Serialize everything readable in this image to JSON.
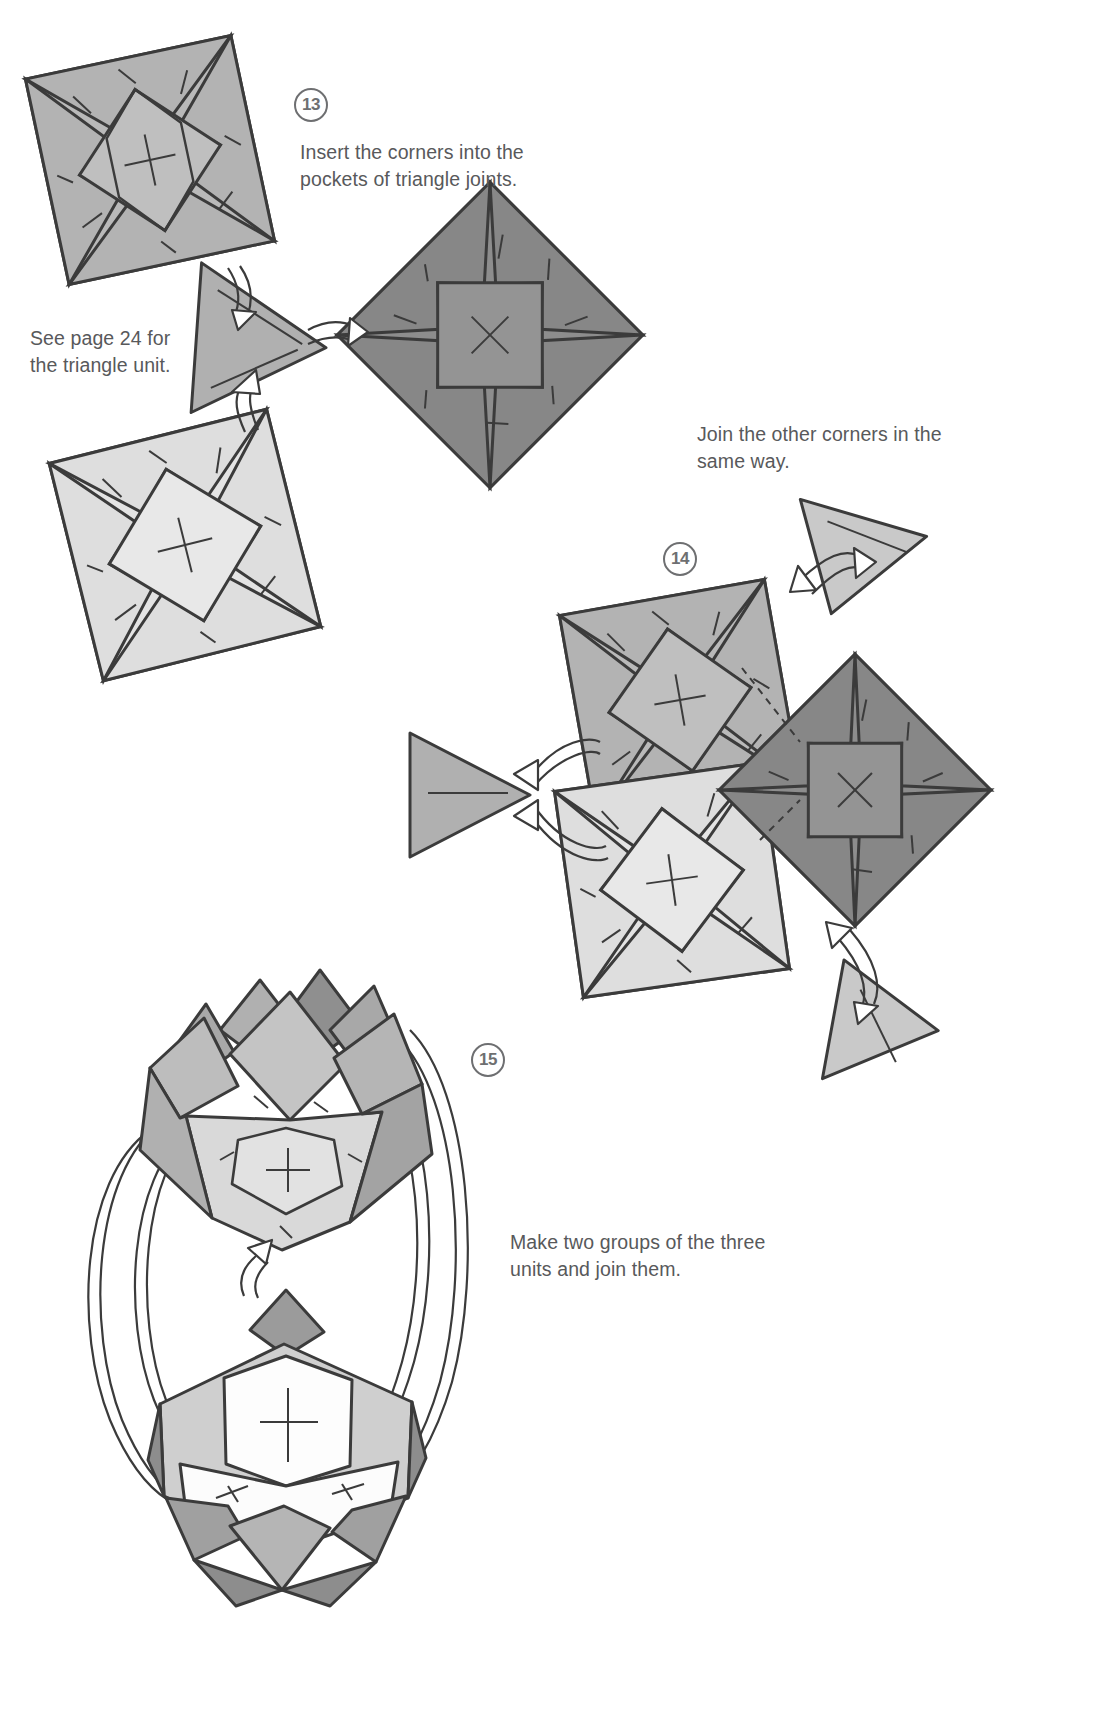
{
  "page": {
    "background": "#ffffff",
    "width": 1093,
    "height": 1735
  },
  "steps": [
    {
      "id": "step-13",
      "number": "13",
      "caption": "Insert the corners into the\npockets of triangle joints.",
      "note": "See page 24 for\nthe triangle unit."
    },
    {
      "id": "step-14",
      "number": "14",
      "caption": "Join the other corners in the\nsame way."
    },
    {
      "id": "step-15",
      "number": "15",
      "caption": "Make two groups of the three\nunits and join them."
    }
  ],
  "colors": {
    "ink": "#3b3b3b",
    "text": "#58595b",
    "square_light": "#e4e4e4",
    "square_mid": "#b9b9b9",
    "square_dark": "#8d8d8d",
    "triangle_mid": "#b0b0b0",
    "triangle_light": "#c9c9c9",
    "arrow_fill": "#ffffff",
    "white_face": "#fdfdfd"
  },
  "figures": {
    "step13": {
      "units": [
        {
          "name": "square-unit-upper-left",
          "tone": "mid"
        },
        {
          "name": "triangle-joint-center",
          "tone": "triangle_mid"
        },
        {
          "name": "square-unit-right-dark",
          "tone": "dark"
        },
        {
          "name": "square-unit-lower-left",
          "tone": "light"
        }
      ],
      "arrows": 2
    },
    "step14": {
      "units": [
        {
          "name": "square-unit-top",
          "tone": "mid"
        },
        {
          "name": "square-unit-bottom",
          "tone": "light"
        },
        {
          "name": "square-unit-right-dark",
          "tone": "dark"
        },
        {
          "name": "triangle-joint-left",
          "tone": "triangle_mid"
        },
        {
          "name": "triangle-joint-top-right",
          "tone": "triangle_light"
        },
        {
          "name": "triangle-joint-bottom-right",
          "tone": "triangle_light"
        }
      ],
      "arrows": 4
    },
    "step15": {
      "units": [
        {
          "name": "assembled-group-upper",
          "tone": "mid"
        },
        {
          "name": "assembled-group-lower",
          "tone": "light"
        }
      ],
      "arrows": 6
    }
  }
}
